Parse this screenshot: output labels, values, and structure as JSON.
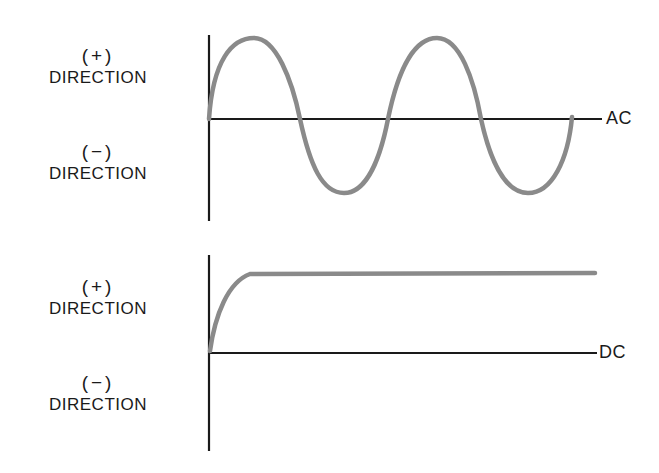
{
  "diagram": {
    "colors": {
      "axis": "#1a1a1a",
      "waveform": "#8a8a8a",
      "background": "#ffffff"
    },
    "panels": [
      {
        "id": "ac",
        "series_label": "AC",
        "positive_label": {
          "sign": "(+)",
          "text": "DIRECTION"
        },
        "negative_label": {
          "sign": "(−)",
          "text": "DIRECTION"
        },
        "waveform": "sine, 2 full cycles starting at zero going positive"
      },
      {
        "id": "dc",
        "series_label": "DC",
        "positive_label": {
          "sign": "(+)",
          "text": "DIRECTION"
        },
        "negative_label": {
          "sign": "(−)",
          "text": "DIRECTION"
        },
        "waveform": "rises quickly from zero to constant positive level"
      }
    ]
  }
}
